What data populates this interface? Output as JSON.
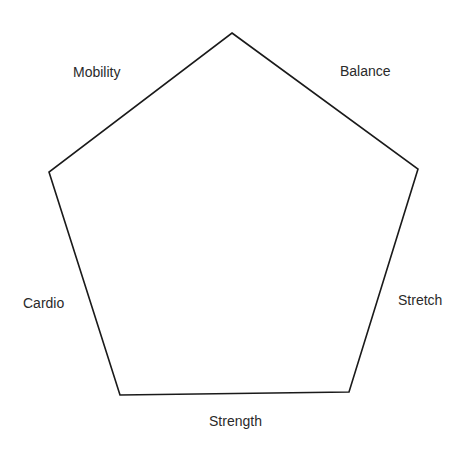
{
  "diagram": {
    "shape": "pentagon",
    "stroke_color": "#1a1a1a",
    "background": "#ffffff",
    "vertices": [
      {
        "x": 232,
        "y": 33
      },
      {
        "x": 418,
        "y": 169
      },
      {
        "x": 349,
        "y": 392
      },
      {
        "x": 120,
        "y": 395
      },
      {
        "x": 49,
        "y": 172
      }
    ],
    "labels": {
      "mobility": "Mobility",
      "balance": "Balance",
      "cardio": "Cardio",
      "stretch": "Stretch",
      "strength": "Strength"
    }
  }
}
